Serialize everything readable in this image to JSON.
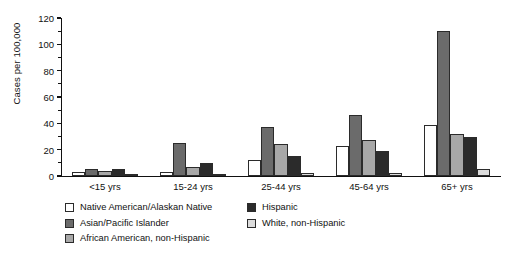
{
  "chart_data": {
    "type": "bar",
    "title": "",
    "xlabel": "",
    "ylabel": "Cases per 100,000",
    "ylim": [
      0,
      120
    ],
    "yticks": [
      0,
      20,
      40,
      60,
      80,
      100,
      120
    ],
    "grid": false,
    "legend_position": "bottom-left",
    "categories": [
      "<15 yrs",
      "15-24 yrs",
      "25-44 yrs",
      "45-64 yrs",
      "65+ yrs"
    ],
    "series": [
      {
        "name": "Native American/Alaskan Native",
        "color": "#ffffff",
        "values": [
          3,
          3,
          12,
          23,
          39
        ]
      },
      {
        "name": "Asian/Pacific Islander",
        "color": "#6b6b6b",
        "values": [
          5,
          25,
          37,
          46,
          110
        ]
      },
      {
        "name": "African American, non-Hispanic",
        "color": "#a8a8a8",
        "values": [
          4,
          7,
          24,
          27,
          32
        ]
      },
      {
        "name": "Hispanic",
        "color": "#2b2b2b",
        "values": [
          5,
          10,
          15,
          19,
          30
        ]
      },
      {
        "name": "White, non-Hispanic",
        "color": "#dcdcdc",
        "values": [
          0,
          1,
          2,
          2,
          5
        ]
      }
    ]
  },
  "axis": {
    "y_title": "Cases per 100,000",
    "y_tick_labels": [
      "0",
      "20",
      "40",
      "60",
      "80",
      "100",
      "120"
    ]
  },
  "legend": {
    "column_left": [
      "Native American/Alaskan Native",
      "Asian/Pacific Islander",
      "African American, non-Hispanic"
    ],
    "column_right": [
      "Hispanic",
      "White, non-Hispanic"
    ]
  }
}
